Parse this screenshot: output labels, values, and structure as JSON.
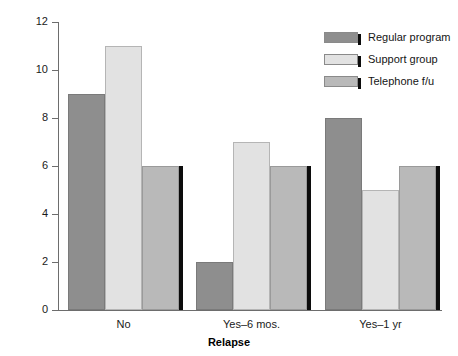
{
  "chart_data": {
    "type": "bar",
    "title": "",
    "subtitle": "",
    "xlabel": "Relapse",
    "ylabel": "Count",
    "categories": [
      "No",
      "Yes–6 mos.",
      "Yes–1 yr"
    ],
    "series": [
      {
        "name": "Regular program",
        "values": [
          9,
          2,
          8
        ],
        "color": "#8e8e8e"
      },
      {
        "name": "Support group",
        "values": [
          11,
          7,
          5
        ],
        "color": "#e2e2e2"
      },
      {
        "name": "Telephone f/u",
        "values": [
          6,
          6,
          6
        ],
        "color": "#b9b9b9"
      }
    ],
    "ylim": [
      0,
      12
    ],
    "yticks": [
      0,
      2,
      4,
      6,
      8,
      10,
      12
    ],
    "ytick_labels": [
      "0",
      "2",
      "4",
      "6",
      "8",
      "10",
      "12"
    ],
    "grid": false,
    "legend_position": "top-right",
    "annotations": []
  },
  "axes": {
    "y_title": "Count",
    "x_title": "Relapse",
    "y_tick_labels": [
      "12",
      "10",
      "8",
      "6",
      "4",
      "2",
      "0"
    ],
    "x_tick_labels": [
      "No",
      "Yes–6 mos.",
      "Yes–1 yr"
    ]
  },
  "legend": {
    "entries": [
      {
        "label": "Regular program",
        "swatch": "legend-swatch-regular-program"
      },
      {
        "label": "Support group",
        "swatch": "legend-swatch-support-group"
      },
      {
        "label": "Telephone f/u",
        "swatch": "legend-swatch-telephone-fu"
      }
    ]
  },
  "colors": {
    "series_regular_program": "#8e8e8e",
    "series_support_group": "#e2e2e2",
    "series_telephone_fu": "#b9b9b9",
    "axis": "#6d6d6d",
    "shadow": "#0c0c0c",
    "background": "#ffffff",
    "text": "#151515"
  }
}
